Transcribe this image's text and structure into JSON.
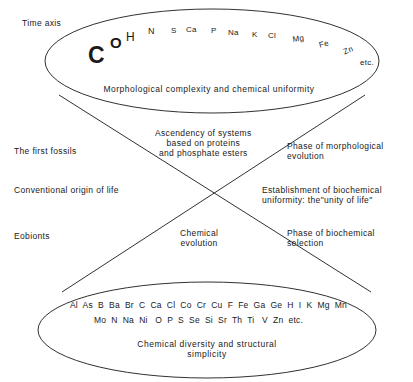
{
  "figure": {
    "type": "diagram"
  },
  "axis": {
    "time_axis_label": "Time axis"
  },
  "top_ellipse": {
    "caption": "Morphological complexity and chemical uniformity",
    "trailing_label": "etc.",
    "elements": [
      {
        "symbol": "C",
        "x": 88,
        "y": 42,
        "size": 23,
        "weight": 700,
        "rotate": 0
      },
      {
        "symbol": "O",
        "x": 110,
        "y": 34,
        "size": 15,
        "weight": 700,
        "rotate": 0
      },
      {
        "symbol": "H",
        "x": 126,
        "y": 30,
        "size": 12,
        "weight": 400,
        "rotate": 0
      },
      {
        "symbol": "N",
        "x": 148,
        "y": 26,
        "size": 9,
        "weight": 400,
        "rotate": 0
      },
      {
        "symbol": "S",
        "x": 171,
        "y": 26,
        "size": 8,
        "weight": 400,
        "rotate": 0
      },
      {
        "symbol": "Ca",
        "x": 186,
        "y": 25,
        "size": 8,
        "weight": 400,
        "rotate": 0
      },
      {
        "symbol": "P",
        "x": 211,
        "y": 26,
        "size": 8,
        "weight": 400,
        "rotate": 0
      },
      {
        "symbol": "Na",
        "x": 228,
        "y": 28,
        "size": 8,
        "weight": 400,
        "rotate": 0
      },
      {
        "symbol": "K",
        "x": 252,
        "y": 30,
        "size": 8,
        "weight": 400,
        "rotate": 0
      },
      {
        "symbol": "Cl",
        "x": 268,
        "y": 31,
        "size": 8,
        "weight": 400,
        "rotate": 0
      },
      {
        "symbol": "Mg",
        "x": 292,
        "y": 35,
        "size": 8,
        "weight": 400,
        "rotate": -8
      },
      {
        "symbol": "Fe",
        "x": 318,
        "y": 41,
        "size": 8,
        "weight": 400,
        "rotate": -14
      },
      {
        "symbol": "Zn",
        "x": 342,
        "y": 48,
        "size": 8,
        "weight": 400,
        "rotate": -22
      }
    ]
  },
  "bottom_ellipse": {
    "caption_line1": "Chemical diversity and structural",
    "caption_line2": "simplicity",
    "element_rows": [
      "Al  As  B  Ba  Br  C  Ca  Cl  Co  Cr  Cu  F  Fe  Ga  Ge  H  I  K  Mg  Mn",
      "Mo  N  Na  Ni   O  P  S  Se  Si  Sr  Th  Ti   V  Zn  etc."
    ]
  },
  "left_labels": [
    {
      "text": "The first fossils",
      "x": 14,
      "y": 146
    },
    {
      "text": "Conventional origin of life",
      "x": 14,
      "y": 185
    },
    {
      "text": "Eobionts",
      "x": 14,
      "y": 231
    }
  ],
  "center_labels": [
    {
      "lines": [
        "Ascendency of systems",
        "based on proteins",
        "and phosphate esters"
      ],
      "x": 155,
      "y": 128
    },
    {
      "lines": [
        "Chemical",
        "evolution"
      ],
      "x": 180,
      "y": 228
    }
  ],
  "right_labels": [
    {
      "lines": [
        "Phase of morphological",
        "evolution"
      ],
      "x": 287,
      "y": 141
    },
    {
      "lines": [
        "Establishment of biochemical",
        "uniformity: the\"unity of life\""
      ],
      "x": 262,
      "y": 185
    },
    {
      "lines": [
        "Phase of biochemical",
        "selection"
      ],
      "x": 287,
      "y": 228
    }
  ],
  "colors": {
    "stroke": "#1a1a1a",
    "background": "#ffffff",
    "text": "#1a1a1a"
  }
}
